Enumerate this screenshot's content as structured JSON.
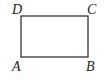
{
  "diagram": {
    "type": "rectangle",
    "stroke_color": "#333333",
    "fill_color": "#ffffff",
    "rect": {
      "x": 21,
      "y": 16,
      "width": 67,
      "height": 41
    },
    "vertices": [
      {
        "label": "A",
        "x": 12,
        "y": 71
      },
      {
        "label": "B",
        "x": 86,
        "y": 71
      },
      {
        "label": "C",
        "x": 87,
        "y": 14
      },
      {
        "label": "D",
        "x": 12,
        "y": 14
      }
    ]
  }
}
